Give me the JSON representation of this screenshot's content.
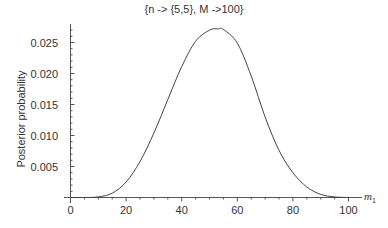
{
  "chart_data": {
    "type": "line",
    "title": "{n -> {5,5}, M ->100}",
    "xlabel": "m₁",
    "ylabel": "Posterior probability",
    "xlim": [
      0,
      100
    ],
    "ylim": [
      0,
      0.0275
    ],
    "grid": false,
    "legend": null,
    "x_ticks": [
      "0",
      "20",
      "40",
      "60",
      "80",
      "100"
    ],
    "y_ticks": [
      "0.005",
      "0.010",
      "0.015",
      "0.020",
      "0.025"
    ],
    "series": [
      {
        "name": "posterior",
        "x": [
          0,
          5,
          10,
          15,
          20,
          25,
          30,
          35,
          40,
          45,
          50,
          53,
          55,
          60,
          65,
          70,
          75,
          80,
          85,
          90,
          95,
          100
        ],
        "y": [
          0,
          0,
          0.0001,
          0.0007,
          0.0025,
          0.0058,
          0.0104,
          0.0158,
          0.0211,
          0.0252,
          0.027,
          0.0272,
          0.0271,
          0.0249,
          0.0196,
          0.013,
          0.0076,
          0.004,
          0.0017,
          0.0005,
          0.0001,
          0
        ]
      }
    ]
  }
}
